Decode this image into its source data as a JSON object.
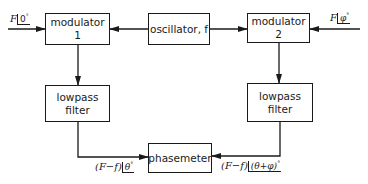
{
  "diagram": {
    "blocks": {
      "modulator1": "modulator 1",
      "oscillator": "oscillator, f",
      "modulator2": "modulator 2",
      "lowpass_left_line1": "lowpass",
      "lowpass_left_line2": "filter",
      "lowpass_right_line1": "lowpass",
      "lowpass_right_line2": "filter",
      "phasemeter": "phasemeter"
    },
    "signals": {
      "input_left": {
        "var": "F",
        "angle": "0",
        "unit": "°"
      },
      "input_right": {
        "var": "F",
        "angle": "φ",
        "unit": "°"
      },
      "output_left": {
        "prefix": "(F−f)",
        "angle": "θ",
        "unit": "°"
      },
      "output_right": {
        "prefix": "(F−f)",
        "angle": "(θ+φ)",
        "unit": "°"
      }
    },
    "colors": {
      "stroke": "#1a1a1a",
      "background": "#ffffff"
    }
  }
}
